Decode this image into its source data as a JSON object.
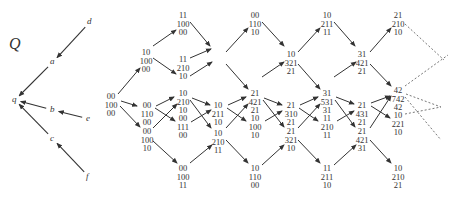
{
  "title": "Q",
  "quiver": {
    "vertices": [
      {
        "id": "d",
        "label": "d",
        "x": 90,
        "y": 22
      },
      {
        "id": "a",
        "label": "a",
        "x": 53,
        "y": 62
      },
      {
        "id": "q",
        "label": "q",
        "x": 15,
        "y": 100
      },
      {
        "id": "b",
        "label": "b",
        "x": 53,
        "y": 110
      },
      {
        "id": "e",
        "label": "e",
        "x": 89,
        "y": 119
      },
      {
        "id": "c",
        "label": "c",
        "x": 53,
        "y": 139
      },
      {
        "id": "f",
        "label": "f",
        "x": 89,
        "y": 177
      }
    ],
    "arrows": [
      {
        "from": "d",
        "to": "a"
      },
      {
        "from": "a",
        "to": "q"
      },
      {
        "from": "b",
        "to": "q"
      },
      {
        "from": "e",
        "to": "b"
      },
      {
        "from": "c",
        "to": "q"
      },
      {
        "from": "f",
        "to": "c"
      }
    ]
  },
  "nodes": [
    {
      "id": "n0",
      "lines": [
        "00",
        "100",
        "00"
      ],
      "x": 111,
      "y": 92
    },
    {
      "id": "n1",
      "lines": [
        "10",
        "100",
        "00"
      ],
      "x": 146,
      "y": 48
    },
    {
      "id": "n2",
      "lines": [
        "00",
        "110",
        "00"
      ],
      "x": 147,
      "y": 101
    },
    {
      "id": "n3",
      "lines": [
        "00",
        "100",
        "10"
      ],
      "x": 147,
      "y": 127
    },
    {
      "id": "n4",
      "lines": [
        "11",
        "100",
        "00"
      ],
      "x": 183,
      "y": 11
    },
    {
      "id": "n5",
      "lines": [
        "11",
        "210",
        "10"
      ],
      "x": 183,
      "y": 55
    },
    {
      "id": "n6",
      "lines": [
        "10",
        "210",
        "10"
      ],
      "x": 183,
      "y": 89
    },
    {
      "id": "n7",
      "lines": [
        "00",
        "111",
        "00"
      ],
      "x": 183,
      "y": 114
    },
    {
      "id": "n8",
      "lines": [
        "00",
        "100",
        "11"
      ],
      "x": 183,
      "y": 164
    },
    {
      "id": "n9",
      "lines": [
        "00",
        "110",
        "10"
      ],
      "x": 255,
      "y": 11
    },
    {
      "id": "n10",
      "lines": [
        "10",
        "211",
        "10"
      ],
      "x": 218,
      "y": 101
    },
    {
      "id": "n11",
      "lines": [
        "10",
        "210",
        "11"
      ],
      "x": 218,
      "y": 129
    },
    {
      "id": "n12",
      "lines": [
        "21",
        "421",
        "21"
      ],
      "x": 255,
      "y": 89
    },
    {
      "id": "n13",
      "lines": [
        "10",
        "100",
        "10"
      ],
      "x": 255,
      "y": 114
    },
    {
      "id": "n14",
      "lines": [
        "10",
        "110",
        "00"
      ],
      "x": 255,
      "y": 164
    },
    {
      "id": "n15",
      "lines": [
        "10",
        "321",
        "21"
      ],
      "x": 291,
      "y": 50
    },
    {
      "id": "n16",
      "lines": [
        "21",
        "310",
        "21"
      ],
      "x": 291,
      "y": 101
    },
    {
      "id": "n17",
      "lines": [
        "21",
        "321",
        "10"
      ],
      "x": 291,
      "y": 127
    },
    {
      "id": "n18",
      "lines": [
        "10",
        "211",
        "11"
      ],
      "x": 327,
      "y": 11
    },
    {
      "id": "n19",
      "lines": [
        "31",
        "531",
        "31"
      ],
      "x": 327,
      "y": 89
    },
    {
      "id": "n20",
      "lines": [
        "11",
        "210",
        "11"
      ],
      "x": 327,
      "y": 114
    },
    {
      "id": "n21",
      "lines": [
        "11",
        "211",
        "10"
      ],
      "x": 327,
      "y": 164
    },
    {
      "id": "n22",
      "lines": [
        "31",
        "421",
        "21"
      ],
      "x": 362,
      "y": 50
    },
    {
      "id": "n23",
      "lines": [
        "21",
        "431",
        "21"
      ],
      "x": 362,
      "y": 101
    },
    {
      "id": "n24",
      "lines": [
        "21",
        "421",
        "31"
      ],
      "x": 362,
      "y": 127
    },
    {
      "id": "n25",
      "lines": [
        "21",
        "210",
        "10"
      ],
      "x": 398,
      "y": 11
    },
    {
      "id": "n26",
      "lines": [
        "42",
        "742",
        "42"
      ],
      "x": 398,
      "y": 86
    },
    {
      "id": "n27",
      "lines": [
        "10",
        "221",
        "10"
      ],
      "x": 398,
      "y": 111
    },
    {
      "id": "n28",
      "lines": [
        "10",
        "210",
        "21"
      ],
      "x": 398,
      "y": 164
    }
  ],
  "edges": [
    {
      "x1": 118,
      "y1": 94,
      "x2": 140,
      "y2": 68
    },
    {
      "x1": 121,
      "y1": 101,
      "x2": 137,
      "y2": 106
    },
    {
      "x1": 120,
      "y1": 106,
      "x2": 140,
      "y2": 127
    },
    {
      "x1": 153,
      "y1": 46,
      "x2": 176,
      "y2": 30
    },
    {
      "x1": 153,
      "y1": 58,
      "x2": 176,
      "y2": 74
    },
    {
      "x1": 156,
      "y1": 106,
      "x2": 174,
      "y2": 97
    },
    {
      "x1": 155,
      "y1": 108,
      "x2": 175,
      "y2": 121
    },
    {
      "x1": 153,
      "y1": 128,
      "x2": 177,
      "y2": 104
    },
    {
      "x1": 153,
      "y1": 141,
      "x2": 177,
      "y2": 163
    },
    {
      "x1": 190,
      "y1": 22,
      "x2": 210,
      "y2": 46
    },
    {
      "x1": 190,
      "y1": 76,
      "x2": 212,
      "y2": 62
    },
    {
      "x1": 192,
      "y1": 98,
      "x2": 210,
      "y2": 105
    },
    {
      "x1": 190,
      "y1": 100,
      "x2": 211,
      "y2": 128
    },
    {
      "x1": 191,
      "y1": 122,
      "x2": 211,
      "y2": 110
    },
    {
      "x1": 190,
      "y1": 163,
      "x2": 212,
      "y2": 145
    },
    {
      "x1": 190,
      "y1": 58,
      "x2": 211,
      "y2": 49
    },
    {
      "x1": 226,
      "y1": 52,
      "x2": 248,
      "y2": 28
    },
    {
      "x1": 226,
      "y1": 64,
      "x2": 248,
      "y2": 89
    },
    {
      "x1": 228,
      "y1": 105,
      "x2": 246,
      "y2": 97
    },
    {
      "x1": 227,
      "y1": 108,
      "x2": 246,
      "y2": 121
    },
    {
      "x1": 226,
      "y1": 128,
      "x2": 248,
      "y2": 104
    },
    {
      "x1": 226,
      "y1": 140,
      "x2": 248,
      "y2": 163
    },
    {
      "x1": 262,
      "y1": 22,
      "x2": 284,
      "y2": 46
    },
    {
      "x1": 264,
      "y1": 98,
      "x2": 282,
      "y2": 105
    },
    {
      "x1": 263,
      "y1": 100,
      "x2": 284,
      "y2": 127
    },
    {
      "x1": 265,
      "y1": 121,
      "x2": 282,
      "y2": 111
    },
    {
      "x1": 262,
      "y1": 165,
      "x2": 284,
      "y2": 145
    },
    {
      "x1": 262,
      "y1": 77,
      "x2": 284,
      "y2": 62
    },
    {
      "x1": 298,
      "y1": 52,
      "x2": 320,
      "y2": 28
    },
    {
      "x1": 298,
      "y1": 64,
      "x2": 320,
      "y2": 89
    },
    {
      "x1": 300,
      "y1": 105,
      "x2": 318,
      "y2": 97
    },
    {
      "x1": 299,
      "y1": 108,
      "x2": 318,
      "y2": 121
    },
    {
      "x1": 298,
      "y1": 128,
      "x2": 320,
      "y2": 104
    },
    {
      "x1": 298,
      "y1": 140,
      "x2": 320,
      "y2": 163
    },
    {
      "x1": 334,
      "y1": 22,
      "x2": 355,
      "y2": 46
    },
    {
      "x1": 336,
      "y1": 97,
      "x2": 354,
      "y2": 104
    },
    {
      "x1": 335,
      "y1": 100,
      "x2": 355,
      "y2": 127
    },
    {
      "x1": 337,
      "y1": 121,
      "x2": 354,
      "y2": 111
    },
    {
      "x1": 334,
      "y1": 165,
      "x2": 356,
      "y2": 145
    },
    {
      "x1": 334,
      "y1": 77,
      "x2": 356,
      "y2": 62
    },
    {
      "x1": 370,
      "y1": 52,
      "x2": 391,
      "y2": 28
    },
    {
      "x1": 370,
      "y1": 64,
      "x2": 391,
      "y2": 86
    },
    {
      "x1": 371,
      "y1": 103,
      "x2": 390,
      "y2": 96
    },
    {
      "x1": 371,
      "y1": 106,
      "x2": 390,
      "y2": 118
    },
    {
      "x1": 370,
      "y1": 128,
      "x2": 391,
      "y2": 96
    },
    {
      "x1": 370,
      "y1": 140,
      "x2": 391,
      "y2": 163
    }
  ],
  "dashed_edges": [
    {
      "x1": 405,
      "y1": 24,
      "x2": 444,
      "y2": 60
    },
    {
      "x1": 405,
      "y1": 86,
      "x2": 448,
      "y2": 55
    },
    {
      "x1": 406,
      "y1": 94,
      "x2": 441,
      "y2": 107
    },
    {
      "x1": 405,
      "y1": 114,
      "x2": 441,
      "y2": 107
    },
    {
      "x1": 405,
      "y1": 97,
      "x2": 441,
      "y2": 140
    }
  ]
}
